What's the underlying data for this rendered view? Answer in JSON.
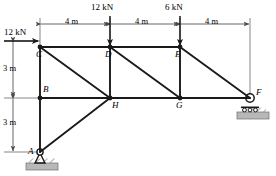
{
  "figure": {
    "type": "truss-free-body-diagram",
    "units": {
      "length": "m",
      "force": "kN"
    },
    "stroke_color": "#1a1a1a",
    "dimension_color": "#555555",
    "ground_fill": "#b8b8b8"
  },
  "joints": [
    {
      "id": "A",
      "label": "A",
      "x": 40,
      "y": 152,
      "label_dx": -12,
      "label_dy": -5,
      "support": "pin"
    },
    {
      "id": "B",
      "label": "B",
      "x": 40,
      "y": 98,
      "label_dx": 3,
      "label_dy": -13,
      "support": "none"
    },
    {
      "id": "C",
      "label": "C",
      "x": 40,
      "y": 47,
      "label_dx": -4,
      "label_dy": 3,
      "support": "none"
    },
    {
      "id": "D",
      "label": "D",
      "x": 110,
      "y": 47,
      "label_dx": -5,
      "label_dy": 3,
      "support": "none"
    },
    {
      "id": "E",
      "label": "E",
      "x": 180,
      "y": 47,
      "label_dx": -5,
      "label_dy": 3,
      "support": "none"
    },
    {
      "id": "F",
      "label": "F",
      "x": 250,
      "y": 98,
      "label_dx": 6,
      "label_dy": -10,
      "support": "roller"
    },
    {
      "id": "G",
      "label": "G",
      "x": 180,
      "y": 98,
      "label_dx": -4,
      "label_dy": 3,
      "support": "none"
    },
    {
      "id": "H",
      "label": "H",
      "x": 110,
      "y": 98,
      "label_dx": 2,
      "label_dy": 3,
      "support": "none"
    }
  ],
  "members": [
    {
      "from": "C",
      "to": "D",
      "chord": "top"
    },
    {
      "from": "D",
      "to": "E",
      "chord": "top"
    },
    {
      "from": "C",
      "to": "B",
      "chord": "vertical"
    },
    {
      "from": "B",
      "to": "A",
      "chord": "vertical"
    },
    {
      "from": "D",
      "to": "H",
      "chord": "vertical"
    },
    {
      "from": "E",
      "to": "G",
      "chord": "vertical"
    },
    {
      "from": "B",
      "to": "H",
      "chord": "bottom"
    },
    {
      "from": "H",
      "to": "G",
      "chord": "bottom"
    },
    {
      "from": "G",
      "to": "F",
      "chord": "bottom"
    },
    {
      "from": "C",
      "to": "H",
      "chord": "diagonal"
    },
    {
      "from": "D",
      "to": "G",
      "chord": "diagonal"
    },
    {
      "from": "E",
      "to": "F",
      "chord": "diagonal"
    },
    {
      "from": "A",
      "to": "H",
      "chord": "diagonal"
    }
  ],
  "loads": [
    {
      "id": "load-at-C",
      "label": "12 kN",
      "magnitude": 12,
      "unit": "kN",
      "direction": "horizontal-right",
      "at_joint": "C",
      "tail_x": 4,
      "tail_y": 41,
      "head_x": 38,
      "head_y": 41,
      "text_x": 4,
      "text_y": 28
    },
    {
      "id": "load-at-D",
      "label": "12 kN",
      "magnitude": 12,
      "unit": "kN",
      "direction": "vertical-down",
      "at_joint": "D",
      "tail_x": 110,
      "tail_y": 16,
      "head_x": 110,
      "head_y": 45,
      "text_x": 91,
      "text_y": 3
    },
    {
      "id": "load-at-E",
      "label": "6 kN",
      "magnitude": 6,
      "unit": "kN",
      "direction": "vertical-down",
      "at_joint": "E",
      "tail_x": 180,
      "tail_y": 16,
      "head_x": 180,
      "head_y": 45,
      "text_x": 165,
      "text_y": 3
    }
  ],
  "dimensions": {
    "horizontal": {
      "axis_y": 24,
      "extension_top": 18,
      "ticks_x": [
        40,
        110,
        180,
        250
      ],
      "spans": [
        {
          "id": "span-C-D",
          "label": "4 m",
          "value": 4,
          "x1": 40,
          "x2": 110,
          "text_x": 65,
          "text_y": 17
        },
        {
          "id": "span-D-E",
          "label": "4 m",
          "value": 4,
          "x1": 110,
          "x2": 180,
          "text_x": 135,
          "text_y": 17
        },
        {
          "id": "span-E-F",
          "label": "4 m",
          "value": 4,
          "x1": 180,
          "x2": 250,
          "text_x": 205,
          "text_y": 17
        }
      ]
    },
    "vertical": {
      "axis_x": 13,
      "ticks_y": [
        41,
        98,
        152
      ],
      "spans": [
        {
          "id": "span-C-B",
          "label": "3 m",
          "value": 3,
          "y1": 41,
          "y2": 98,
          "text_x": 3,
          "text_y": 64
        },
        {
          "id": "span-B-A",
          "label": "3 m",
          "value": 3,
          "y1": 98,
          "y2": 152,
          "text_x": 3,
          "text_y": 118
        }
      ]
    }
  },
  "supports": [
    {
      "id": "support-A",
      "type": "pin",
      "joint": "A",
      "x": 40,
      "y": 152,
      "base_x": 26,
      "base_y": 163,
      "base_w": 32,
      "base_h": 7
    },
    {
      "id": "support-F",
      "type": "roller",
      "joint": "F",
      "x": 250,
      "y": 98,
      "base_x": 237,
      "base_y": 112,
      "base_w": 32,
      "base_h": 7
    }
  ]
}
